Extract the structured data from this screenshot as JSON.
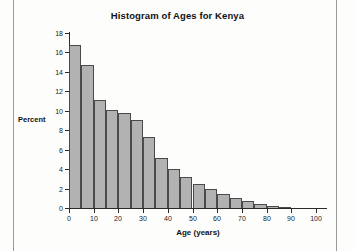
{
  "chart_data": {
    "type": "bar",
    "title": "Histogram of Ages for Kenya",
    "xlabel": "Age (years)",
    "ylabel": "Percent",
    "xlim": [
      0,
      105
    ],
    "ylim": [
      0,
      18
    ],
    "grid": false,
    "legend": null,
    "bin_width": 5,
    "xticks": [
      0,
      10,
      20,
      30,
      40,
      50,
      60,
      70,
      80,
      90,
      100
    ],
    "xtick_labels": [
      "0",
      "10",
      "20",
      "30",
      "40",
      "50",
      "60",
      "70",
      "80",
      "90",
      "100"
    ],
    "yticks": [
      0,
      2,
      4,
      6,
      8,
      10,
      12,
      14,
      16,
      18
    ],
    "ytick_labels": [
      "0",
      "2",
      "4",
      "6",
      "8",
      "10",
      "12",
      "14",
      "16",
      "18"
    ],
    "bins": [
      {
        "x0": 0,
        "x1": 5,
        "label": "0-5",
        "value": 16.8
      },
      {
        "x0": 5,
        "x1": 10,
        "label": "5-10",
        "value": 14.7
      },
      {
        "x0": 10,
        "x1": 15,
        "label": "10-15",
        "value": 11.1
      },
      {
        "x0": 15,
        "x1": 20,
        "label": "15-20",
        "value": 10.1
      },
      {
        "x0": 20,
        "x1": 25,
        "label": "20-25",
        "value": 9.8
      },
      {
        "x0": 25,
        "x1": 30,
        "label": "25-30",
        "value": 9.1
      },
      {
        "x0": 30,
        "x1": 35,
        "label": "30-35",
        "value": 7.3
      },
      {
        "x0": 35,
        "x1": 40,
        "label": "35-40",
        "value": 5.1
      },
      {
        "x0": 40,
        "x1": 45,
        "label": "40-45",
        "value": 4.0
      },
      {
        "x0": 45,
        "x1": 50,
        "label": "45-50",
        "value": 3.2
      },
      {
        "x0": 50,
        "x1": 55,
        "label": "50-55",
        "value": 2.5
      },
      {
        "x0": 55,
        "x1": 60,
        "label": "55-60",
        "value": 2.0
      },
      {
        "x0": 60,
        "x1": 65,
        "label": "60-65",
        "value": 1.45
      },
      {
        "x0": 65,
        "x1": 70,
        "label": "65-70",
        "value": 1.05
      },
      {
        "x0": 70,
        "x1": 75,
        "label": "70-75",
        "value": 0.75
      },
      {
        "x0": 75,
        "x1": 80,
        "label": "75-80",
        "value": 0.45
      },
      {
        "x0": 80,
        "x1": 85,
        "label": "80-85",
        "value": 0.25
      },
      {
        "x0": 85,
        "x1": 90,
        "label": "85-90",
        "value": 0.1
      }
    ],
    "categories": [
      "0-5",
      "5-10",
      "10-15",
      "15-20",
      "20-25",
      "25-30",
      "30-35",
      "35-40",
      "40-45",
      "45-50",
      "50-55",
      "55-60",
      "60-65",
      "65-70",
      "70-75",
      "75-80",
      "80-85",
      "85-90"
    ],
    "values": [
      16.8,
      14.7,
      11.1,
      10.1,
      9.8,
      9.1,
      7.3,
      5.1,
      4.0,
      3.2,
      2.5,
      2.0,
      1.45,
      1.05,
      0.75,
      0.45,
      0.25,
      0.1
    ],
    "colors": {
      "bar_fill": "#b2b2b2",
      "bar_edge": "#4a4a4a",
      "axis": "#2a2a2a",
      "text": "#111111",
      "background": "#fdfdfc"
    }
  }
}
